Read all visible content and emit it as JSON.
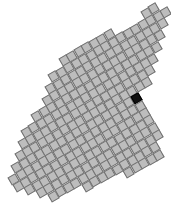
{
  "game": {
    "title": "",
    "grid": {
      "pitch": 8.6,
      "tile_size": 8.6,
      "rotation_deg": -30,
      "origin": [
        90,
        105
      ],
      "tile_color": "#bdbdbd",
      "border_color": "#6f6f6f",
      "selected_color": "#111111",
      "selected_tile": [
        141,
        96
      ]
    },
    "shape_outline": [
      [
        152,
        0
      ],
      [
        170,
        10
      ],
      [
        152,
        70
      ],
      [
        150,
        86
      ],
      [
        142,
        92
      ],
      [
        150,
        108
      ],
      [
        160,
        128
      ],
      [
        162,
        160
      ],
      [
        135,
        172
      ],
      [
        88,
        186
      ],
      [
        48,
        198
      ],
      [
        8,
        186
      ],
      [
        22,
        140
      ],
      [
        46,
        92
      ],
      [
        62,
        56
      ],
      [
        100,
        34
      ],
      [
        136,
        28
      ]
    ]
  }
}
